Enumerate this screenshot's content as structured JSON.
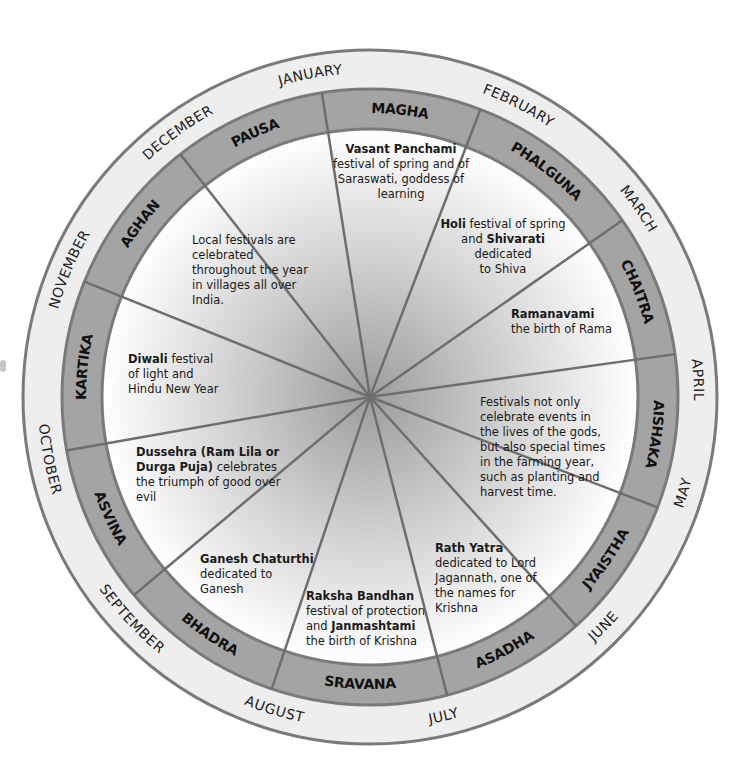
{
  "diagram": {
    "center": [
      370,
      397
    ],
    "colors": {
      "outer_ring": "#eeeeee",
      "hindu_ring": "#a4a4a4",
      "outline": "#7a7a7a",
      "spokes": "#6e6e6e",
      "inner_center": "#9c9c9c",
      "inner_edge": "#ffffff"
    },
    "gregorian_months": [
      {
        "label": "JANUARY",
        "angle": 259.5,
        "dir": "cw"
      },
      {
        "label": "FEBRUARY",
        "angle": 297,
        "dir": "cw"
      },
      {
        "label": "MARCH",
        "angle": 325,
        "dir": "cw"
      },
      {
        "label": "APRIL",
        "angle": 357,
        "dir": "cw"
      },
      {
        "label": "MAY",
        "angle": 17,
        "dir": "ccw"
      },
      {
        "label": "JUNE",
        "angle": 44.5,
        "dir": "ccw"
      },
      {
        "label": "JULY",
        "angle": 77,
        "dir": "ccw"
      },
      {
        "label": "AUGUST",
        "angle": 107,
        "dir": "ccw"
      },
      {
        "label": "SEPTEMBER",
        "angle": 137,
        "dir": "ccw"
      },
      {
        "label": "OCTOBER",
        "angle": 169,
        "dir": "ccw"
      },
      {
        "label": "NOVEMBER",
        "angle": 203,
        "dir": "cw"
      },
      {
        "label": "DECEMBER",
        "angle": 234,
        "dir": "cw"
      }
    ],
    "hindu_months": [
      {
        "label": "MAGHA",
        "angle": 276,
        "dir": "cw"
      },
      {
        "label": "PHALGUNA",
        "angle": 308,
        "dir": "cw"
      },
      {
        "label": "CHAITRA",
        "angle": 338.5,
        "dir": "cw"
      },
      {
        "label": "VAISHAKA",
        "angle": 6.5,
        "dir": "cw"
      },
      {
        "label": "JYAISTHA",
        "angle": 34.5,
        "dir": "ccw"
      },
      {
        "label": "ASADHA",
        "angle": 62,
        "dir": "ccw"
      },
      {
        "label": "SRAVANA",
        "angle": 92,
        "dir": "ccw"
      },
      {
        "label": "BHADRA",
        "angle": 124,
        "dir": "ccw"
      },
      {
        "label": "ASVINA",
        "angle": 155,
        "dir": "ccw"
      },
      {
        "label": "KARTIKA",
        "angle": 186,
        "dir": "cw"
      },
      {
        "label": "AGHAN",
        "angle": 217,
        "dir": "cw"
      },
      {
        "label": "PAUSA",
        "angle": 246.5,
        "dir": "cw"
      }
    ],
    "spoke_angles": [
      261,
      291,
      325,
      352,
      21,
      48,
      75.5,
      108.6,
      140,
      170,
      202,
      232
    ],
    "festivals": {
      "magha": {
        "bold": "Vasant Panchami",
        "text": "festival of spring and of Saraswati, goddess of learning"
      },
      "phalguna": {
        "bold": "Holi",
        "text1": "festival of spring and",
        "bold2": "Shivarati",
        "text2": "dedicated to Shiva"
      },
      "chaitra": {
        "bold": "Ramanavami",
        "text": "the birth of Rama"
      },
      "vaishaka_note": {
        "text": "Festivals not only celebrate events in the lives of the gods, but also special times in the farming year, such as planting and harvest time."
      },
      "asadha": {
        "bold": "Rath Yatra",
        "text": "dedicated to Lord Jagannath, one of the names for Krishna"
      },
      "sravana": {
        "bold": "Raksha Bandhan",
        "text1": "festival of protection and",
        "bold2": "Janmashtami",
        "text2": "the birth of Krishna"
      },
      "bhadra": {
        "bold": "Ganesh Chaturthi",
        "text": "dedicated to Ganesh"
      },
      "asvina": {
        "bold": "Dussehra (Ram Lila or Durga Puja)",
        "text": "celebrates the triumph of good over evil"
      },
      "kartika": {
        "bold": "Diwali",
        "text": "festival of light and Hindu New Year"
      },
      "aghan_note": {
        "text": "Local festivals are celebrated throughout the year in villages all over India."
      }
    }
  }
}
